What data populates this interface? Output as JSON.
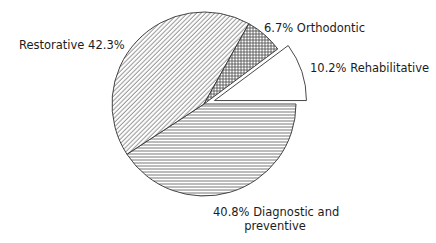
{
  "chart_data": {
    "type": "pie",
    "title": "",
    "start_angle_deg": 0,
    "direction": "clockwise",
    "categories": [
      "Diagnostic and preventive",
      "Restorative",
      "Orthodontic",
      "Rehabilitative"
    ],
    "values": [
      40.8,
      42.3,
      6.7,
      10.2
    ],
    "unit": "%",
    "slices": [
      {
        "name": "Diagnostic and preventive",
        "value": 40.8,
        "pattern": "horizontal-lines",
        "exploded": false
      },
      {
        "name": "Restorative",
        "value": 42.3,
        "pattern": "diagonal-lines",
        "exploded": false
      },
      {
        "name": "Orthodontic",
        "value": 6.7,
        "pattern": "crosshatch",
        "exploded": false
      },
      {
        "name": "Rehabilitative",
        "value": 10.2,
        "pattern": "solid-white",
        "exploded": true
      }
    ],
    "legend": "none (direct labels)"
  },
  "labels": {
    "restorative": "Restorative 42.3%",
    "orthodontic": "6.7% Orthodontic",
    "rehabilitative": "10.2% Rehabilitative",
    "diagnostic_line1": "40.8% Diagnostic and",
    "diagnostic_line2": "preventive"
  },
  "colors": {
    "stroke": "#333333",
    "hatch": "#555555",
    "background": "#ffffff",
    "fill_plain": "#ffffff"
  }
}
